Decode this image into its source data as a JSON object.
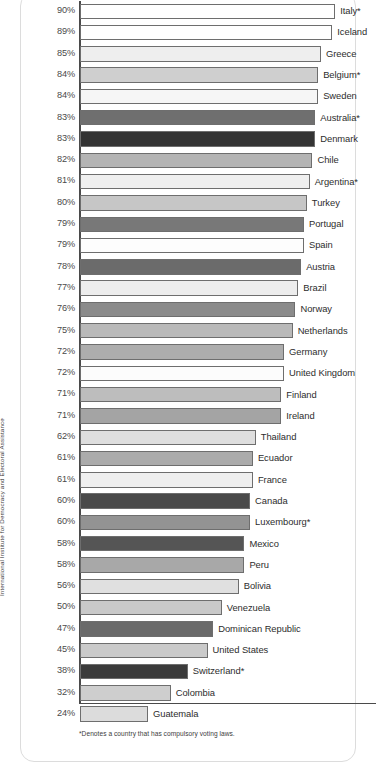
{
  "source_label": "International Institute for Democracy and Electoral Assistance",
  "footnote": "*Denotes a country that has compulsory voting laws.",
  "chart_data": {
    "type": "bar",
    "orientation": "horizontal",
    "title": "",
    "subtitle": "",
    "xlabel": "",
    "ylabel": "",
    "xlim": [
      0,
      90
    ],
    "grid": false,
    "legend": null,
    "value_suffix": "%",
    "categories": [
      "Italy*",
      "Iceland",
      "Greece",
      "Belgium*",
      "Sweden",
      "Australia*",
      "Denmark",
      "Chile",
      "Argentina*",
      "Turkey",
      "Portugal",
      "Spain",
      "Austria",
      "Brazil",
      "Norway",
      "Netherlands",
      "Germany",
      "United Kingdom",
      "Finland",
      "Ireland",
      "Thailand",
      "Ecuador",
      "France",
      "Canada",
      "Luxembourg*",
      "Mexico",
      "Peru",
      "Bolivia",
      "Venezuela",
      "Dominican Republic",
      "United States",
      "Switzerland*",
      "Colombia",
      "Guatemala"
    ],
    "values": [
      90,
      89,
      85,
      84,
      84,
      83,
      83,
      82,
      81,
      80,
      79,
      79,
      78,
      77,
      76,
      75,
      72,
      72,
      71,
      71,
      62,
      61,
      61,
      60,
      60,
      58,
      58,
      56,
      50,
      47,
      45,
      38,
      32,
      24
    ],
    "bars": [
      {
        "country": "Italy*",
        "value": 90,
        "label": "90%",
        "color": "#ffffff"
      },
      {
        "country": "Iceland",
        "value": 89,
        "label": "89%",
        "color": "#ffffff"
      },
      {
        "country": "Greece",
        "value": 85,
        "label": "85%",
        "color": "#eeeeee"
      },
      {
        "country": "Belgium*",
        "value": 84,
        "label": "84%",
        "color": "#cfcfcf"
      },
      {
        "country": "Sweden",
        "value": 84,
        "label": "84%",
        "color": "#f6f6f6"
      },
      {
        "country": "Australia*",
        "value": 83,
        "label": "83%",
        "color": "#6f6f6f"
      },
      {
        "country": "Denmark",
        "value": 83,
        "label": "83%",
        "color": "#343434"
      },
      {
        "country": "Chile",
        "value": 82,
        "label": "82%",
        "color": "#b4b4b4"
      },
      {
        "country": "Argentina*",
        "value": 81,
        "label": "81%",
        "color": "#efefef"
      },
      {
        "country": "Turkey",
        "value": 80,
        "label": "80%",
        "color": "#c6c6c6"
      },
      {
        "country": "Portugal",
        "value": 79,
        "label": "79%",
        "color": "#787878"
      },
      {
        "country": "Spain",
        "value": 79,
        "label": "79%",
        "color": "#fdfdfd"
      },
      {
        "country": "Austria",
        "value": 78,
        "label": "78%",
        "color": "#6b6b6b"
      },
      {
        "country": "Brazil",
        "value": 77,
        "label": "77%",
        "color": "#ededed"
      },
      {
        "country": "Norway",
        "value": 76,
        "label": "76%",
        "color": "#8b8b8b"
      },
      {
        "country": "Netherlands",
        "value": 75,
        "label": "75%",
        "color": "#b9b9b9"
      },
      {
        "country": "Germany",
        "value": 72,
        "label": "72%",
        "color": "#adadad"
      },
      {
        "country": "United Kingdom",
        "value": 72,
        "label": "72%",
        "color": "#fcfcfc"
      },
      {
        "country": "Finland",
        "value": 71,
        "label": "71%",
        "color": "#bdbdbd"
      },
      {
        "country": "Ireland",
        "value": 71,
        "label": "71%",
        "color": "#a4a4a4"
      },
      {
        "country": "Thailand",
        "value": 62,
        "label": "62%",
        "color": "#dedede"
      },
      {
        "country": "Ecuador",
        "value": 61,
        "label": "61%",
        "color": "#ababab"
      },
      {
        "country": "France",
        "value": 61,
        "label": "61%",
        "color": "#efefef"
      },
      {
        "country": "Canada",
        "value": 60,
        "label": "60%",
        "color": "#4a4a4a"
      },
      {
        "country": "Luxembourg*",
        "value": 60,
        "label": "60%",
        "color": "#939393"
      },
      {
        "country": "Mexico",
        "value": 58,
        "label": "58%",
        "color": "#555555"
      },
      {
        "country": "Peru",
        "value": 58,
        "label": "58%",
        "color": "#a8a8a8"
      },
      {
        "country": "Bolivia",
        "value": 56,
        "label": "56%",
        "color": "#e0e0e0"
      },
      {
        "country": "Venezuela",
        "value": 50,
        "label": "50%",
        "color": "#c9c9c9"
      },
      {
        "country": "Dominican Republic",
        "value": 47,
        "label": "47%",
        "color": "#6a6a6a"
      },
      {
        "country": "United States",
        "value": 45,
        "label": "45%",
        "color": "#cacaca"
      },
      {
        "country": "Switzerland*",
        "value": 38,
        "label": "38%",
        "color": "#3b3b3b"
      },
      {
        "country": "Colombia",
        "value": 32,
        "label": "32%",
        "color": "#cecece"
      },
      {
        "country": "Guatemala",
        "value": 24,
        "label": "24%",
        "color": "#dcdcdc"
      }
    ]
  }
}
